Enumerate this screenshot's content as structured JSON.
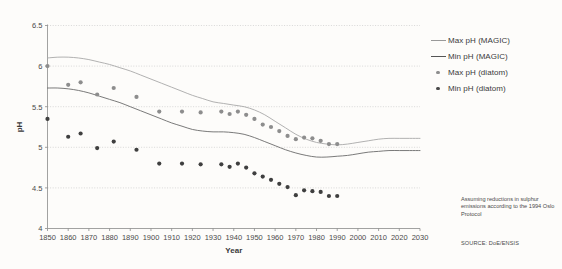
{
  "chart_data": {
    "type": "scatter",
    "title": "",
    "xlabel": "Year",
    "ylabel": "pH",
    "xlim": [
      1850,
      2030
    ],
    "ylim": [
      4,
      6.5
    ],
    "grid": true,
    "legend_position": "right",
    "x_ticks": [
      1850,
      1860,
      1870,
      1880,
      1890,
      1900,
      1910,
      1920,
      1930,
      1940,
      1950,
      1960,
      1970,
      1980,
      1990,
      2000,
      2010,
      2020,
      2030
    ],
    "y_ticks": [
      4,
      4.5,
      5,
      5.5,
      6,
      6.5
    ],
    "series": [
      {
        "name": "Max pH (MAGIC)",
        "type": "line",
        "color": "#a8a8a8",
        "x": [
          1850,
          1855,
          1860,
          1865,
          1870,
          1875,
          1880,
          1885,
          1890,
          1895,
          1900,
          1905,
          1910,
          1915,
          1920,
          1925,
          1930,
          1935,
          1940,
          1945,
          1950,
          1955,
          1960,
          1965,
          1970,
          1975,
          1980,
          1985,
          1990,
          1995,
          2000,
          2005,
          2010,
          2015,
          2020,
          2025,
          2030
        ],
        "y": [
          6.1,
          6.11,
          6.11,
          6.1,
          6.08,
          6.05,
          6.02,
          5.98,
          5.94,
          5.89,
          5.84,
          5.79,
          5.74,
          5.69,
          5.64,
          5.6,
          5.56,
          5.54,
          5.52,
          5.5,
          5.46,
          5.4,
          5.32,
          5.24,
          5.16,
          5.1,
          5.06,
          5.04,
          5.03,
          5.04,
          5.06,
          5.08,
          5.1,
          5.11,
          5.11,
          5.11,
          5.11
        ]
      },
      {
        "name": "Min pH (MAGIC)",
        "type": "line",
        "color": "#6b6b6b",
        "x": [
          1850,
          1855,
          1860,
          1865,
          1870,
          1875,
          1880,
          1885,
          1890,
          1895,
          1900,
          1905,
          1910,
          1915,
          1920,
          1925,
          1930,
          1935,
          1940,
          1945,
          1950,
          1955,
          1960,
          1965,
          1970,
          1975,
          1980,
          1985,
          1990,
          1995,
          2000,
          2005,
          2010,
          2015,
          2020,
          2025,
          2030
        ],
        "y": [
          5.73,
          5.73,
          5.72,
          5.7,
          5.67,
          5.63,
          5.59,
          5.55,
          5.5,
          5.45,
          5.4,
          5.35,
          5.3,
          5.26,
          5.22,
          5.2,
          5.19,
          5.19,
          5.18,
          5.16,
          5.12,
          5.07,
          5.02,
          4.97,
          4.93,
          4.9,
          4.88,
          4.88,
          4.89,
          4.9,
          4.92,
          4.94,
          4.95,
          4.96,
          4.96,
          4.96,
          4.96
        ]
      },
      {
        "name": "Max pH (diatom)",
        "type": "scatter",
        "color": "#8d8d8d",
        "x": [
          1850,
          1860,
          1866,
          1874,
          1882,
          1893,
          1904,
          1915,
          1924,
          1934,
          1938,
          1942,
          1946,
          1950,
          1954,
          1958,
          1962,
          1966,
          1970,
          1974,
          1978,
          1982,
          1986,
          1990
        ],
        "y": [
          6.0,
          5.77,
          5.8,
          5.65,
          5.73,
          5.62,
          5.44,
          5.44,
          5.43,
          5.44,
          5.41,
          5.44,
          5.4,
          5.35,
          5.28,
          5.25,
          5.2,
          5.14,
          5.1,
          5.12,
          5.11,
          5.08,
          5.04,
          5.04
        ]
      },
      {
        "name": "Min pH (diatom)",
        "type": "scatter",
        "color": "#3f3f3f",
        "x": [
          1850,
          1860,
          1866,
          1874,
          1882,
          1893,
          1904,
          1915,
          1924,
          1934,
          1938,
          1942,
          1946,
          1950,
          1954,
          1958,
          1962,
          1966,
          1970,
          1974,
          1978,
          1982,
          1986,
          1990
        ],
        "y": [
          5.35,
          5.13,
          5.17,
          4.99,
          5.07,
          4.97,
          4.8,
          4.8,
          4.79,
          4.79,
          4.76,
          4.8,
          4.75,
          4.68,
          4.64,
          4.6,
          4.55,
          4.51,
          4.41,
          4.47,
          4.46,
          4.45,
          4.4,
          4.4
        ]
      }
    ]
  },
  "legend": {
    "items": [
      {
        "label": "Max pH (MAGIC)",
        "key": "line-light"
      },
      {
        "label": "Min pH (MAGIC)",
        "key": "line-dark"
      },
      {
        "label": "Max pH (diatom)",
        "key": "dot-light"
      },
      {
        "label": "Min pH (diatom)",
        "key": "dot-dark"
      }
    ]
  },
  "annotations": {
    "note": "Assuming reductions in sulphur emissions according to the 1994 Oslo Protocol",
    "source": "SOURCE: DoE/ENSIS"
  },
  "colors": {
    "background": "#fdfcfa",
    "axis": "#8a8a8a",
    "grid": "#c9c9c9",
    "line_max": "#a8a8a8",
    "line_min": "#6b6b6b",
    "dot_max": "#8d8d8d",
    "dot_min": "#3f3f3f",
    "text": "#3a3a3a"
  }
}
